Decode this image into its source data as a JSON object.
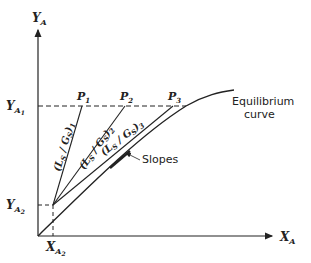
{
  "diagram": {
    "axes": {
      "y_label": "Y",
      "y_sub": "A",
      "x_label": "X",
      "x_sub": "A"
    },
    "ticks": {
      "y_a1": "Y",
      "y_a1_sub": "A",
      "y_a1_subsub": "1",
      "y_a2": "Y",
      "y_a2_sub": "A",
      "y_a2_subsub": "2",
      "x_a2": "X",
      "x_a2_sub": "A",
      "x_a2_subsub": "2"
    },
    "points": [
      {
        "label": "P",
        "sub": "1"
      },
      {
        "label": "P",
        "sub": "2"
      },
      {
        "label": "P",
        "sub": "3"
      }
    ],
    "operating_lines": [
      {
        "label": "(L",
        "s": "S",
        "mid": " / G",
        "s2": "S",
        "close": ")",
        "sub": "1"
      },
      {
        "label": "(L",
        "s": "S",
        "mid": " / G",
        "s2": "S",
        "close": ")",
        "sub": "2"
      },
      {
        "label": "(L",
        "s": "S",
        "mid": " / G",
        "s2": "S",
        "close": ")",
        "sub": "3"
      }
    ],
    "curve_label_line1": "Equilibrium",
    "curve_label_line2": "curve",
    "slopes_label": "Slopes",
    "colors": {
      "ink": "#222222",
      "background": "#ffffff"
    }
  }
}
